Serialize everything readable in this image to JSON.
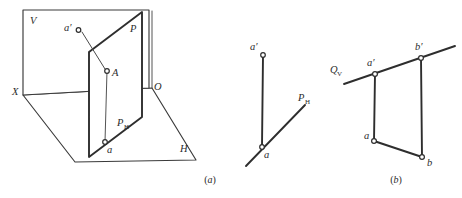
{
  "figure": {
    "background_color": "#ffffff",
    "line_color": "#3a3a3a",
    "node_fill": "#ffffff",
    "width": 462,
    "height": 198
  },
  "panel_a": {
    "caption_open": "(",
    "caption_letter": "a",
    "caption_close": ")",
    "labels": {
      "v_plane": "V",
      "h_plane": "H",
      "x_axis": "X",
      "origin": "O",
      "p_plane": "P",
      "point_space": "A",
      "point_vertical_projection": "a′",
      "point_horizontal_projection": "a",
      "p_trace_base": "P",
      "p_trace_sub": "H"
    },
    "geometry_note": "Vertical plane V (rectangle), horizontal plane H (parallelogram), auxiliary plane P (parallelogram) intersecting both; point A with projections a and a′"
  },
  "panel_middle": {
    "labels": {
      "point_vertical_projection": "a′",
      "point_horizontal_projection": "a",
      "p_trace_base": "P",
      "p_trace_sub": "H"
    },
    "geometry_note": "Projection of single point A: vertical recall line from a′ down to a lying on oblique trace P_H"
  },
  "panel_b": {
    "caption_open": "(",
    "caption_letter": "b",
    "caption_close": ")",
    "labels": {
      "q_trace_base": "Q",
      "q_trace_sub": "V",
      "point_a_vertical": "a′",
      "point_b_vertical": "b′",
      "point_a_horizontal": "a",
      "point_b_horizontal": "b"
    },
    "geometry_note": "Line AB: vertical projections a′ b′ lying on trace Q_V, horizontal projections a b below, joined by recall lines"
  }
}
